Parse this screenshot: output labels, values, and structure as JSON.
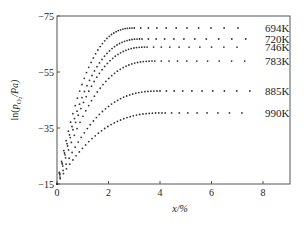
{
  "chart_data": {
    "type": "scatter",
    "title": "",
    "xlabel": "x/%",
    "ylabel": "ln(p_O2/Pa)",
    "ylabel_parts": {
      "prefix": "ln(",
      "p": "p",
      "sub": "O",
      "sub2": "2",
      "suffix": "/Pa)"
    },
    "xlim": [
      0,
      9
    ],
    "ylim": [
      -15,
      -75
    ],
    "x_ticks": [
      0,
      2,
      4,
      6,
      8
    ],
    "y_ticks": [
      -75,
      -55,
      -35,
      -15
    ],
    "grid": false,
    "legend_position": "right-inline",
    "series": [
      {
        "name": "694K",
        "plateau": -70.7,
        "saturation_x": 3.0,
        "x_end": 7.5
      },
      {
        "name": "720K",
        "plateau": -66.8,
        "saturation_x": 3.3,
        "x_end": 7.5
      },
      {
        "name": "746K",
        "plateau": -63.9,
        "saturation_x": 3.5,
        "x_end": 7.5
      },
      {
        "name": "783K",
        "plateau": -58.9,
        "saturation_x": 3.8,
        "x_end": 7.5
      },
      {
        "name": "885K",
        "plateau": -48.2,
        "saturation_x": 4.0,
        "x_end": 7.5
      },
      {
        "name": "990K",
        "plateau": -40.4,
        "saturation_x": 4.2,
        "x_end": 7.5
      }
    ],
    "start_value": -15
  },
  "labels": {
    "x_axis_title": "x/%"
  }
}
